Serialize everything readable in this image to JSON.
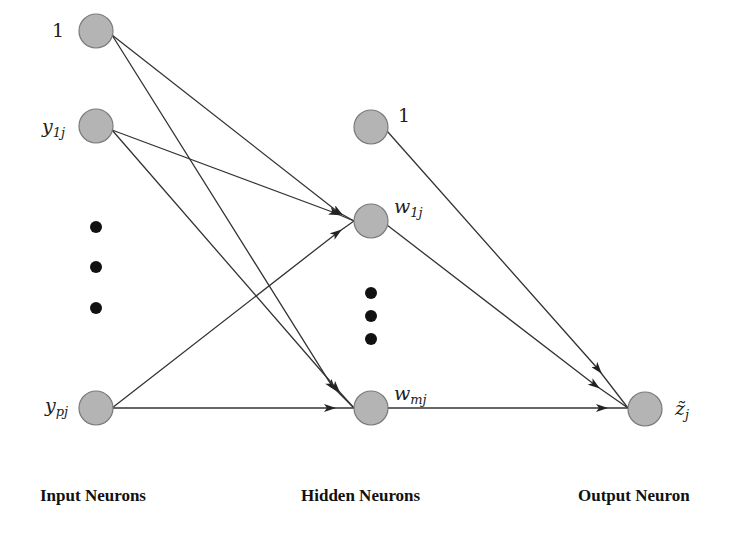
{
  "diagram": {
    "type": "neural-network",
    "layers": [
      {
        "id": "input",
        "label": "Input Neurons"
      },
      {
        "id": "hidden",
        "label": "Hidden Neurons"
      },
      {
        "id": "output",
        "label": "Output Neuron"
      }
    ],
    "nodes": {
      "in_bias": {
        "label": "1"
      },
      "in_y1": {
        "label_base": "y",
        "label_sub": "1j"
      },
      "in_yp": {
        "label_base": "y",
        "label_sub": "pj"
      },
      "hid_bias": {
        "label": "1"
      },
      "hid_w1": {
        "label_base": "w",
        "label_sub": "1j"
      },
      "hid_wm": {
        "label_base": "w",
        "label_sub": "mj"
      },
      "out_z": {
        "label_base": "z̃",
        "label_sub": "j"
      }
    },
    "edges": [
      {
        "from": "in_bias",
        "to": "hid_w1"
      },
      {
        "from": "in_bias",
        "to": "hid_wm"
      },
      {
        "from": "in_y1",
        "to": "hid_w1"
      },
      {
        "from": "in_y1",
        "to": "hid_wm"
      },
      {
        "from": "in_yp",
        "to": "hid_w1"
      },
      {
        "from": "in_yp",
        "to": "hid_wm"
      },
      {
        "from": "hid_bias",
        "to": "out_z"
      },
      {
        "from": "hid_w1",
        "to": "out_z"
      },
      {
        "from": "hid_wm",
        "to": "out_z"
      }
    ],
    "ellipsis": [
      "input column (between y1j and ypj)",
      "hidden column (between w1j and wmj)"
    ],
    "colors": {
      "node_fill": "#b4b4b4",
      "node_stroke": "#7a7a7a",
      "edge": "#333333",
      "dots": "#111111"
    }
  }
}
